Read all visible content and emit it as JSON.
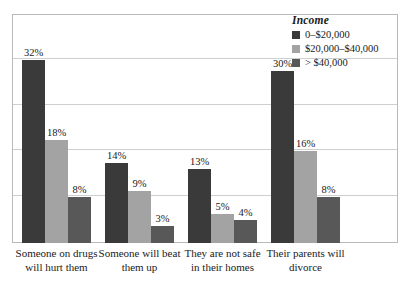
{
  "chart_data": {
    "type": "bar",
    "title": "",
    "xlabel": "",
    "ylabel": "",
    "ylim": [
      0,
      40
    ],
    "grid": true,
    "grid_step": 8,
    "legend_position": "top-right",
    "legend_title": "Income",
    "categories": [
      "Someone on drugs will hurt them",
      "Someone will beat them up",
      "They are not safe in their homes",
      "Their parents will divorce"
    ],
    "series": [
      {
        "name": "0–$20,000",
        "color": "#3a3a3a",
        "values": [
          32,
          14,
          13,
          30
        ],
        "labels": [
          "32%",
          "14%",
          "13%",
          "30%"
        ]
      },
      {
        "name": "$20,000–$40,000",
        "color": "#a3a3a3",
        "values": [
          18,
          9,
          5,
          16
        ],
        "labels": [
          "18%",
          "9%",
          "5%",
          "16%"
        ]
      },
      {
        "name": "> $40,000",
        "color": "#585858",
        "values": [
          8,
          3,
          4,
          8
        ],
        "labels": [
          "8%",
          "3%",
          "4%",
          "8%"
        ]
      }
    ]
  }
}
